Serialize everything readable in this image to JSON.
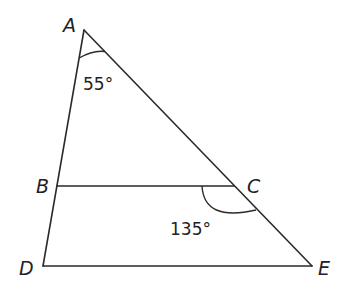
{
  "diagram": {
    "type": "triangle with parallel segment",
    "vertices": {
      "A": {
        "label": "A",
        "x": 84,
        "y": 30
      },
      "B": {
        "label": "B",
        "x": 57,
        "y": 186
      },
      "C": {
        "label": "C",
        "x": 234,
        "y": 186
      },
      "D": {
        "label": "D",
        "x": 43,
        "y": 266
      },
      "E": {
        "label": "E",
        "x": 312,
        "y": 266
      }
    },
    "segments": [
      "AD",
      "AE",
      "BC",
      "DE"
    ],
    "angles": [
      {
        "at": "A",
        "between": "BAC",
        "label": "55°"
      },
      {
        "at": "C",
        "between": "BCE",
        "label": "135°"
      }
    ],
    "colors": {
      "line": "#2a2a2a",
      "text": "#222222",
      "background": "#ffffff"
    }
  }
}
